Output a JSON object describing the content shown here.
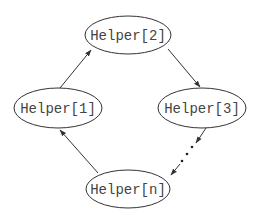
{
  "diagram": {
    "type": "cycle",
    "nodes": [
      {
        "id": "h1",
        "label": "Helper[1]"
      },
      {
        "id": "h2",
        "label": "Helper[2]"
      },
      {
        "id": "h3",
        "label": "Helper[3]"
      },
      {
        "id": "hn",
        "label": "Helper[n]"
      }
    ],
    "edges": [
      {
        "from": "h1",
        "to": "h2",
        "style": "solid"
      },
      {
        "from": "h2",
        "to": "h3",
        "style": "solid"
      },
      {
        "from": "h3",
        "to": "hn",
        "style": "dotted-ellipsis"
      },
      {
        "from": "hn",
        "to": "h1",
        "style": "solid"
      }
    ]
  },
  "colors": {
    "stroke": "#333333",
    "text": "#444444",
    "background": "#ffffff"
  }
}
